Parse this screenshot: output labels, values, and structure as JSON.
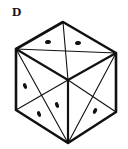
{
  "figure": {
    "label": "D",
    "faces": {
      "top": {
        "dots": 2
      },
      "left": {
        "dots": 3
      },
      "right": {
        "dots": 1
      }
    },
    "colors": {
      "ink": "#111111",
      "background": "#ffffff"
    }
  }
}
